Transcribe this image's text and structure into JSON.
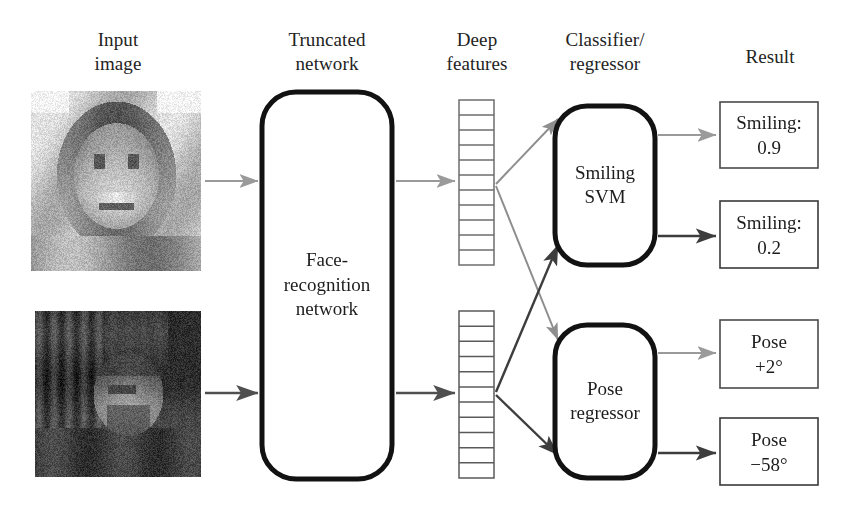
{
  "figure": {
    "type": "pipeline-diagram"
  },
  "columns": [
    {
      "id": "input-image",
      "line1": "Input",
      "line2": "image",
      "cx": 118,
      "top": 28
    },
    {
      "id": "truncated-network",
      "line1": "Truncated",
      "line2": "network",
      "cx": 327,
      "top": 28
    },
    {
      "id": "deep-features",
      "line1": "Deep",
      "line2": "features",
      "cx": 477,
      "top": 28
    },
    {
      "id": "classifier-regressor",
      "line1": "Classifier/",
      "line2": "regressor",
      "cx": 605,
      "top": 28
    },
    {
      "id": "result",
      "line1": "Result",
      "line2": "",
      "cx": 770,
      "top": 45
    }
  ],
  "inputs": [
    {
      "id": "input-image-smiling",
      "alt": "grayscale photo of a smiling woman facing the camera",
      "x": 31,
      "y": 91,
      "w": 170,
      "h": 180,
      "seed": 11,
      "tone": "light"
    },
    {
      "id": "input-image-profile",
      "alt": "grayscale photo of a man in profile view",
      "x": 35,
      "y": 311,
      "w": 166,
      "h": 166,
      "seed": 29,
      "tone": "dark"
    }
  ],
  "network": {
    "id": "face-recognition-network",
    "label_lines": [
      "Face-",
      "recognition",
      "network"
    ],
    "x": 262,
    "y": 92,
    "w": 130,
    "h": 387,
    "rx": 34,
    "stroke": "#121212",
    "stroke_width": 5
  },
  "features": [
    {
      "id": "deep-feature-column-top",
      "x": 459,
      "y": 100,
      "w": 35,
      "h": 165,
      "cells": 11,
      "stroke": "#6d6d6d"
    },
    {
      "id": "deep-feature-column-bottom",
      "x": 459,
      "y": 311,
      "w": 35,
      "h": 167,
      "cells": 11,
      "stroke": "#5a5a5a"
    }
  ],
  "classifiers": [
    {
      "id": "smiling-svm",
      "label_lines": [
        "Smiling",
        "SVM"
      ],
      "x": 555,
      "y": 106,
      "w": 100,
      "h": 159,
      "rx": 32,
      "stroke": "#121212",
      "stroke_width": 5
    },
    {
      "id": "pose-regressor",
      "label_lines": [
        "Pose",
        "regressor"
      ],
      "x": 555,
      "y": 325,
      "w": 100,
      "h": 153,
      "rx": 32,
      "stroke": "#121212",
      "stroke_width": 5
    }
  ],
  "results": [
    {
      "id": "result-smiling-09",
      "line1": "Smiling:",
      "line2": "0.9",
      "x": 720,
      "y": 102,
      "w": 98,
      "h": 66,
      "stroke": "#4a4a4a"
    },
    {
      "id": "result-smiling-02",
      "line1": "Smiling:",
      "line2": "0.2",
      "x": 720,
      "y": 201,
      "w": 98,
      "h": 67,
      "stroke": "#3a3a3a"
    },
    {
      "id": "result-pose-plus2",
      "line1": "Pose",
      "line2": "+2°",
      "x": 720,
      "y": 320,
      "w": 98,
      "h": 68,
      "stroke": "#4a4a4a"
    },
    {
      "id": "result-pose-minus58",
      "line1": "Pose",
      "line2": "−58°",
      "x": 720,
      "y": 418,
      "w": 98,
      "h": 67,
      "stroke": "#3a3a3a"
    }
  ],
  "arrows": [
    {
      "id": "arrow-image-top-to-network",
      "x1": 205,
      "y1": 181,
      "x2": 258,
      "y2": 181,
      "color": "#9a9a9a",
      "width": 2.2
    },
    {
      "id": "arrow-image-bottom-to-network",
      "x1": 205,
      "y1": 393,
      "x2": 258,
      "y2": 393,
      "color": "#4f4f4f",
      "width": 2.6
    },
    {
      "id": "arrow-network-to-features-top",
      "x1": 396,
      "y1": 181,
      "x2": 455,
      "y2": 181,
      "color": "#9a9a9a",
      "width": 2.2
    },
    {
      "id": "arrow-network-to-features-bottom",
      "x1": 396,
      "y1": 393,
      "x2": 455,
      "y2": 393,
      "color": "#4f4f4f",
      "width": 2.6
    },
    {
      "id": "arrow-features-top-to-svm",
      "x1": 496,
      "y1": 184,
      "x2": 558,
      "y2": 119,
      "color": "#8e8e8e",
      "width": 2.0
    },
    {
      "id": "arrow-features-top-to-pose",
      "x1": 496,
      "y1": 186,
      "x2": 558,
      "y2": 340,
      "color": "#8e8e8e",
      "width": 2.0
    },
    {
      "id": "arrow-features-bottom-to-svm",
      "x1": 496,
      "y1": 392,
      "x2": 558,
      "y2": 245,
      "color": "#3d3d3d",
      "width": 2.4
    },
    {
      "id": "arrow-features-bottom-to-pose",
      "x1": 496,
      "y1": 395,
      "x2": 558,
      "y2": 455,
      "color": "#3d3d3d",
      "width": 2.4
    },
    {
      "id": "arrow-svm-to-result-09",
      "x1": 658,
      "y1": 135,
      "x2": 716,
      "y2": 135,
      "color": "#9a9a9a",
      "width": 2.2
    },
    {
      "id": "arrow-svm-to-result-02",
      "x1": 658,
      "y1": 236,
      "x2": 716,
      "y2": 236,
      "color": "#3d3d3d",
      "width": 2.4
    },
    {
      "id": "arrow-pose-to-result-plus2",
      "x1": 658,
      "y1": 353,
      "x2": 716,
      "y2": 353,
      "color": "#9a9a9a",
      "width": 2.2
    },
    {
      "id": "arrow-pose-to-result-minus58",
      "x1": 658,
      "y1": 453,
      "x2": 716,
      "y2": 453,
      "color": "#3d3d3d",
      "width": 2.4
    }
  ]
}
